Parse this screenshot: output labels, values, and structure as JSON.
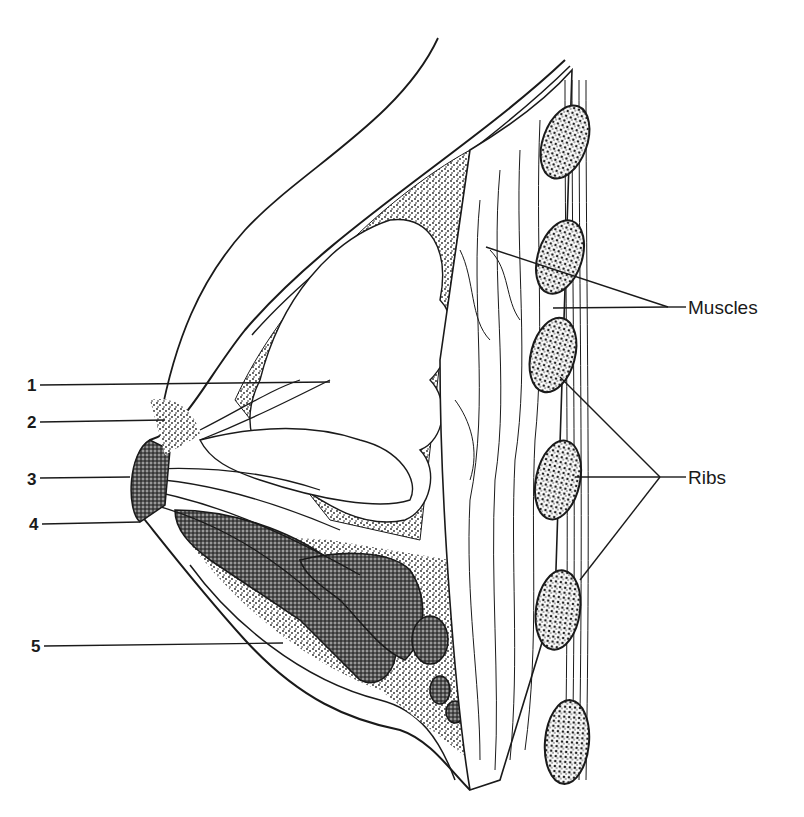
{
  "diagram": {
    "type": "anatomical cross-section",
    "numbered_labels": [
      {
        "id": "1",
        "text": "1"
      },
      {
        "id": "2",
        "text": "2"
      },
      {
        "id": "3",
        "text": "3"
      },
      {
        "id": "4",
        "text": "4"
      },
      {
        "id": "5",
        "text": "5"
      }
    ],
    "named_labels": {
      "muscles": "Muscles",
      "ribs": "Ribs"
    },
    "colors": {
      "ink": "#1a1a1a",
      "background": "#ffffff",
      "stipple": "#333333"
    }
  }
}
